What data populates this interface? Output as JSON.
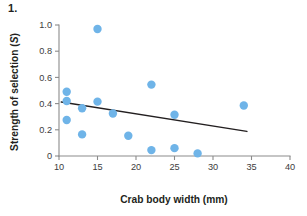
{
  "figure": {
    "number_label": "1."
  },
  "chart_data": {
    "type": "scatter",
    "title": "",
    "xlabel": "Crab body width (mm)",
    "ylabel": "Strength of selection (S)",
    "ylabel_plain": "Strength of selection (",
    "ylabel_italic": "S",
    "ylabel_close": ")",
    "xlim": [
      10,
      40
    ],
    "ylim": [
      0,
      1.0
    ],
    "grid": false,
    "legend": "none",
    "xticks": [
      10,
      15,
      20,
      25,
      30,
      35,
      40
    ],
    "xtick_labels": [
      "10",
      "15",
      "20",
      "25",
      "30",
      "35",
      "40"
    ],
    "yticks": [
      0,
      0.2,
      0.4,
      0.6,
      0.8,
      1.0
    ],
    "ytick_labels": [
      "0",
      "0.2",
      "0.4",
      "0.6",
      "0.8",
      "1.0"
    ],
    "marker_color": "#6fb4e8",
    "marker_radius_px": 4.2,
    "points": [
      {
        "x": 11.0,
        "y": 0.49
      },
      {
        "x": 11.0,
        "y": 0.42
      },
      {
        "x": 11.0,
        "y": 0.275
      },
      {
        "x": 13.0,
        "y": 0.365
      },
      {
        "x": 13.0,
        "y": 0.165
      },
      {
        "x": 15.0,
        "y": 0.97
      },
      {
        "x": 15.0,
        "y": 0.415
      },
      {
        "x": 17.0,
        "y": 0.325
      },
      {
        "x": 19.0,
        "y": 0.155
      },
      {
        "x": 22.0,
        "y": 0.545
      },
      {
        "x": 22.0,
        "y": 0.045
      },
      {
        "x": 25.0,
        "y": 0.315
      },
      {
        "x": 25.0,
        "y": 0.06
      },
      {
        "x": 28.0,
        "y": 0.02
      },
      {
        "x": 34.0,
        "y": 0.385
      }
    ],
    "trend_line": {
      "color": "#231f20",
      "x0": 10.3,
      "y0": 0.412,
      "x1": 34.4,
      "y1": 0.188
    }
  }
}
